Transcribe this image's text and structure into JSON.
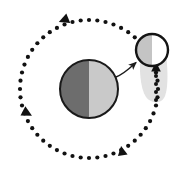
{
  "figure": {
    "background_color": "#ffffff",
    "width": 186,
    "height": 171
  },
  "orbit": {
    "name": "dotted-orbit-path",
    "center": [
      89,
      89
    ],
    "radius_x": 69,
    "radius_y": 69,
    "dot_color": "#111111",
    "dot_radius": 2.1,
    "dot_count": 52,
    "direction": "counterclockwise",
    "arrowheads": [
      {
        "label": "top-arrowhead",
        "angle_deg": 255,
        "x": 60,
        "y": 19,
        "rotation_deg": -15
      },
      {
        "label": "left-arrowhead",
        "angle_deg": 165,
        "x": 20,
        "y": 112,
        "rotation_deg": 210
      },
      {
        "label": "bottom-right-arrowhead",
        "angle_deg": 60,
        "x": 124,
        "y": 151,
        "rotation_deg": 65
      }
    ]
  },
  "primary_body": {
    "name": "main-sphere",
    "center": [
      89,
      89
    ],
    "radius": 29,
    "outline_color": "#1a1a1a",
    "outline_width": 2,
    "left_half_color": "#6d6d6d",
    "right_half_color": "#c9c9c9",
    "terminator": "vertical"
  },
  "inset_body": {
    "name": "inset-sphere",
    "center": [
      152,
      50
    ],
    "radius": 16,
    "outline_color": "#141414",
    "outline_width": 2.4,
    "left_half_color": "#c4c4c4",
    "right_half_color": "#ffffff",
    "terminator": "vertical"
  },
  "inset_trail": {
    "name": "inset-motion-trail",
    "fill_color": "#e2e2e2",
    "top": 50,
    "bottom": 104,
    "left": 140,
    "right": 168,
    "dot_color": "#111111",
    "dot_radius": 2.0,
    "dots": [
      {
        "x": 156,
        "y": 76
      },
      {
        "x": 156,
        "y": 84
      },
      {
        "x": 156,
        "y": 92
      },
      {
        "x": 156,
        "y": 100
      }
    ],
    "arrowhead": {
      "label": "inset-up-arrowhead",
      "x": 156,
      "y": 67,
      "rotation_deg": 0
    }
  },
  "callout_arrow": {
    "name": "magnify-callout-arrow",
    "from": [
      116,
      77
    ],
    "to": [
      137,
      62
    ],
    "color": "#1c1c1c",
    "stroke_width": 1.4
  }
}
